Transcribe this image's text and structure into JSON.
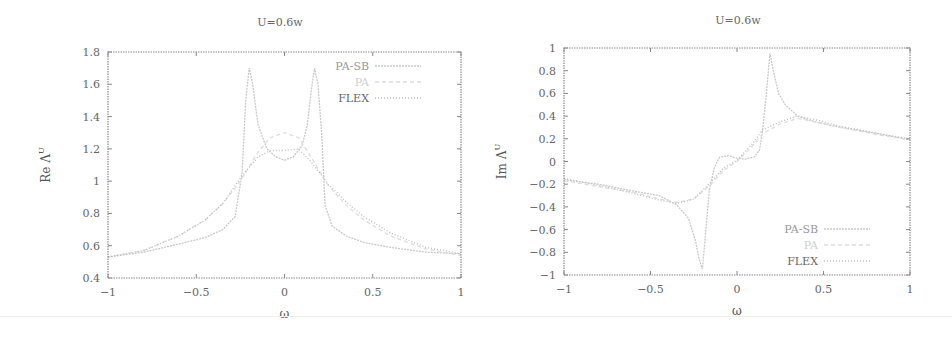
{
  "chart_data": [
    {
      "type": "line",
      "title": "U=0.6w",
      "xlabel": "ω",
      "ylabel": "Re Λ^U",
      "xlim": [
        -1,
        1
      ],
      "ylim": [
        0.4,
        1.8
      ],
      "xticks": [
        "-1",
        "-0.5",
        "0",
        "0.5",
        "1"
      ],
      "yticks": [
        "0.4",
        "0.6",
        "0.8",
        "1",
        "1.2",
        "1.4",
        "1.6",
        "1.8"
      ],
      "grid": false,
      "legend_position": "top-right",
      "series": [
        {
          "name": "PA-SB",
          "color": "#c9c9c9",
          "dash": "2,1",
          "x": [
            -1,
            -0.8,
            -0.6,
            -0.45,
            -0.35,
            -0.28,
            -0.24,
            -0.22,
            -0.2,
            -0.18,
            -0.15,
            -0.1,
            -0.05,
            0,
            0.05,
            0.1,
            0.13,
            0.15,
            0.17,
            0.19,
            0.21,
            0.23,
            0.27,
            0.35,
            0.45,
            0.6,
            0.8,
            1
          ],
          "y": [
            0.53,
            0.56,
            0.61,
            0.65,
            0.7,
            0.78,
            1.05,
            1.5,
            1.7,
            1.6,
            1.35,
            1.2,
            1.15,
            1.13,
            1.15,
            1.22,
            1.35,
            1.55,
            1.7,
            1.6,
            1.3,
            0.85,
            0.72,
            0.66,
            0.62,
            0.59,
            0.56,
            0.55
          ]
        },
        {
          "name": "PA",
          "color": "#dddddd",
          "dash": "4,3",
          "x": [
            -1,
            -0.8,
            -0.6,
            -0.45,
            -0.35,
            -0.25,
            -0.15,
            -0.08,
            0,
            0.08,
            0.15,
            0.25,
            0.35,
            0.45,
            0.6,
            0.8,
            1
          ],
          "y": [
            0.53,
            0.57,
            0.66,
            0.76,
            0.86,
            1.0,
            1.18,
            1.27,
            1.3,
            1.27,
            1.15,
            0.97,
            0.85,
            0.76,
            0.66,
            0.58,
            0.54
          ]
        },
        {
          "name": "FLEX",
          "color": "#bdbdbd",
          "dash": "1,2",
          "x": [
            -1,
            -0.8,
            -0.6,
            -0.45,
            -0.35,
            -0.25,
            -0.15,
            -0.08,
            0,
            0.08,
            0.15,
            0.25,
            0.35,
            0.45,
            0.6,
            0.8,
            1
          ],
          "y": [
            0.53,
            0.57,
            0.66,
            0.76,
            0.86,
            1.02,
            1.15,
            1.19,
            1.19,
            1.2,
            1.12,
            0.98,
            0.87,
            0.78,
            0.68,
            0.59,
            0.55
          ]
        }
      ]
    },
    {
      "type": "line",
      "title": "U=0.6w",
      "xlabel": "ω",
      "ylabel": "Im Λ^U",
      "xlim": [
        -1,
        1
      ],
      "ylim": [
        -1,
        1
      ],
      "xticks": [
        "-1",
        "-0.5",
        "0",
        "0.5",
        "1"
      ],
      "yticks": [
        "-1",
        "-0.8",
        "-0.6",
        "-0.4",
        "-0.2",
        "0",
        "0.2",
        "0.4",
        "0.6",
        "0.8",
        "1"
      ],
      "grid": false,
      "legend_position": "bottom-right",
      "series": [
        {
          "name": "PA-SB",
          "color": "#c9c9c9",
          "dash": "2,1",
          "x": [
            -1,
            -0.8,
            -0.6,
            -0.45,
            -0.35,
            -0.28,
            -0.24,
            -0.22,
            -0.2,
            -0.18,
            -0.16,
            -0.13,
            -0.1,
            -0.05,
            0,
            0.05,
            0.1,
            0.13,
            0.15,
            0.17,
            0.19,
            0.21,
            0.24,
            0.28,
            0.35,
            0.45,
            0.6,
            0.8,
            1
          ],
          "y": [
            -0.16,
            -0.2,
            -0.26,
            -0.3,
            -0.38,
            -0.5,
            -0.7,
            -0.85,
            -0.95,
            -0.6,
            -0.25,
            -0.05,
            0.04,
            0.05,
            0.03,
            0.02,
            0.04,
            0.1,
            0.3,
            0.6,
            0.95,
            0.8,
            0.6,
            0.5,
            0.4,
            0.35,
            0.3,
            0.25,
            0.19
          ]
        },
        {
          "name": "PA",
          "color": "#dddddd",
          "dash": "4,3",
          "x": [
            -1,
            -0.8,
            -0.6,
            -0.45,
            -0.35,
            -0.25,
            -0.15,
            -0.08,
            0,
            0.08,
            0.15,
            0.25,
            0.35,
            0.45,
            0.6,
            0.8,
            1
          ],
          "y": [
            -0.17,
            -0.22,
            -0.27,
            -0.33,
            -0.36,
            -0.33,
            -0.2,
            -0.08,
            0.0,
            0.12,
            0.25,
            0.33,
            0.38,
            0.35,
            0.3,
            0.24,
            0.19
          ]
        },
        {
          "name": "FLEX",
          "color": "#bdbdbd",
          "dash": "1,2",
          "x": [
            -1,
            -0.8,
            -0.6,
            -0.45,
            -0.35,
            -0.25,
            -0.15,
            -0.08,
            0,
            0.08,
            0.15,
            0.25,
            0.35,
            0.45,
            0.6,
            0.8,
            1
          ],
          "y": [
            -0.15,
            -0.21,
            -0.28,
            -0.34,
            -0.37,
            -0.33,
            -0.18,
            -0.06,
            0.01,
            0.14,
            0.28,
            0.35,
            0.4,
            0.37,
            0.31,
            0.25,
            0.2
          ]
        }
      ]
    }
  ]
}
